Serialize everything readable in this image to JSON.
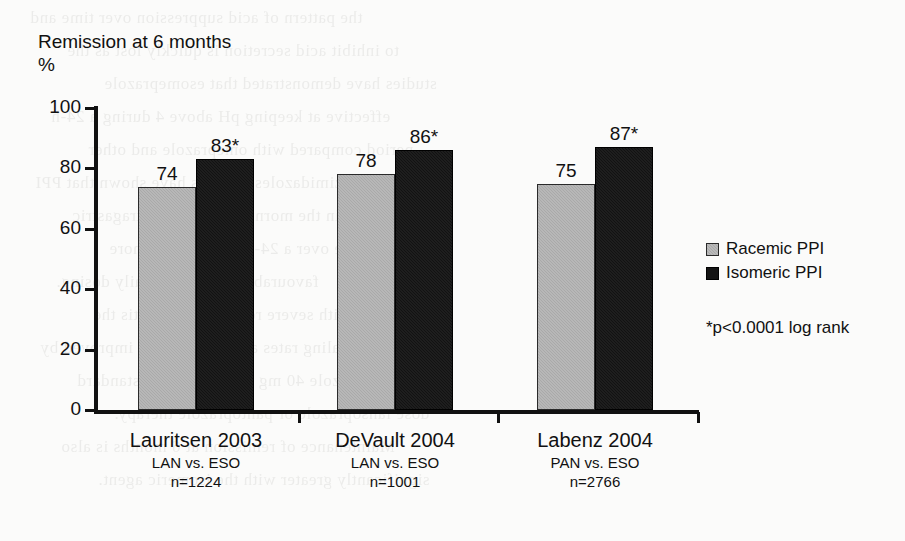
{
  "chart_data": {
    "type": "bar",
    "title": "Remission at 6 months",
    "ylabel": "%",
    "xlabel": "",
    "ylim": [
      0,
      100
    ],
    "yticks": [
      "0",
      "20",
      "40",
      "60",
      "80",
      "100"
    ],
    "ytick_values": [
      0,
      20,
      40,
      60,
      80,
      100
    ],
    "grid": false,
    "legend_position": "right",
    "categories": [
      "Lauritsen 2003",
      "DeVault 2004",
      "Labenz 2004"
    ],
    "category_sublabels": [
      {
        "comparison": "LAN vs. ESO",
        "n": "n=1224"
      },
      {
        "comparison": "LAN vs. ESO",
        "n": "n=1001"
      },
      {
        "comparison": "PAN vs. ESO",
        "n": "n=2766"
      }
    ],
    "series": [
      {
        "name": "Racemic PPI",
        "color": "#a9a9a9",
        "values": [
          74,
          78,
          75
        ],
        "labels": [
          "74",
          "78",
          "75"
        ]
      },
      {
        "name": "Isomeric PPI",
        "color": "#121212",
        "values": [
          83,
          86,
          87
        ],
        "labels": [
          "83*",
          "86*",
          "87*"
        ]
      }
    ],
    "annotations": [
      "*p<0.0001 log rank"
    ]
  },
  "chart": {
    "title": "Remission at 6 months",
    "unit_label": "%"
  },
  "legend": {
    "items": [
      {
        "label": "Racemic PPI",
        "swatch": "gray-square-icon"
      },
      {
        "label": "Isomeric PPI",
        "swatch": "black-square-icon"
      }
    ]
  },
  "footnote": {
    "text": "*p<0.0001 log rank"
  },
  "yaxis": {
    "ticks": [
      "100",
      "80",
      "60",
      "40",
      "20",
      "0"
    ]
  },
  "groups": [
    {
      "name": "Lauritsen 2003",
      "comparison": "LAN vs. ESO",
      "n": "n=1224",
      "bars": [
        {
          "series": "Racemic PPI",
          "value": 74,
          "label": "74"
        },
        {
          "series": "Isomeric PPI",
          "value": 83,
          "label": "83*"
        }
      ]
    },
    {
      "name": "DeVault 2004",
      "comparison": "LAN vs. ESO",
      "n": "n=1001",
      "bars": [
        {
          "series": "Racemic PPI",
          "value": 78,
          "label": "78"
        },
        {
          "series": "Isomeric PPI",
          "value": 86,
          "label": "86*"
        }
      ]
    },
    {
      "name": "Labenz 2004",
      "comparison": "PAN vs. ESO",
      "n": "n=2766",
      "bars": [
        {
          "series": "Racemic PPI",
          "value": 75,
          "label": "75"
        },
        {
          "series": "Isomeric PPI",
          "value": 87,
          "label": "87*"
        }
      ]
    }
  ],
  "ghost_text": {
    "lines": [
      "the pattern of acid suppression over time and",
      "to inhibit acid secretion is quickly lost as the",
      "studies have demonstrated that esomeprazole",
      "effective at keeping pH above 4 during a 24-h",
      "period compared with omeprazole and other",
      "benzimidazoles. Studies have shown that PPI",
      "when given in the morning dose, the intragastric",
      "pH profile over a 24-hour period is more",
      "favourable with twice-daily dosing.",
      "In patients with severe reflux oesophagitis the",
      "healing rates are significantly improved by",
      "esomeprazole 40 mg compared with standard",
      "dose lansoprazole or pantoprazole therapy.",
      "Maintenance of remission at 6 months is also",
      "significantly greater with the isomeric agent."
    ]
  }
}
